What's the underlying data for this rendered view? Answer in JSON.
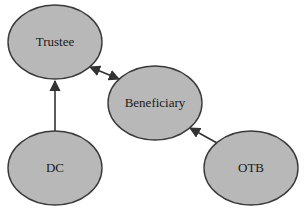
{
  "diagram": {
    "type": "relationship-diagram",
    "colors": {
      "node_fill": "#b8b8b8",
      "node_stroke": "#3a3a3a",
      "edge": "#333333",
      "background": "#ffffff"
    },
    "nodes": [
      {
        "id": "trustee",
        "label": "Trustee",
        "cx": 55,
        "cy": 42,
        "rx": 47,
        "ry": 37
      },
      {
        "id": "beneficiary",
        "label": "Beneficiary",
        "cx": 155,
        "cy": 103,
        "rx": 47,
        "ry": 37
      },
      {
        "id": "dc",
        "label": "DC",
        "cx": 55,
        "cy": 168,
        "rx": 47,
        "ry": 37
      },
      {
        "id": "otb",
        "label": "OTB",
        "cx": 251,
        "cy": 168,
        "rx": 47,
        "ry": 37
      }
    ],
    "edges": [
      {
        "from": "trustee",
        "to": "beneficiary",
        "direction": "both"
      },
      {
        "from": "dc",
        "to": "trustee",
        "direction": "forward"
      },
      {
        "from": "otb",
        "to": "beneficiary",
        "direction": "forward"
      }
    ]
  }
}
